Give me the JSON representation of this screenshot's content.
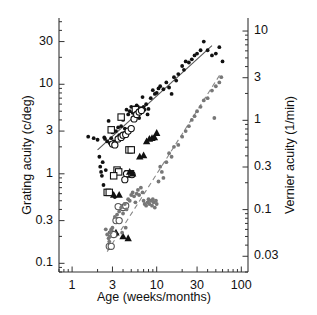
{
  "chart_data": {
    "type": "scatter",
    "title": "",
    "xlabel": "Age (weeks/months)",
    "ylabel": "Grating acuity (c/deg)",
    "ylabel_right": "Vernier acuity (1/min)",
    "xscale": "log",
    "yscale": "log",
    "xlim": [
      0.7,
      120
    ],
    "ylim": [
      0.08,
      55
    ],
    "ylim_right": [
      0.02,
      14
    ],
    "xticks": [
      1,
      3,
      10,
      30,
      100
    ],
    "xticklabels": [
      "1",
      "3",
      "10",
      "30",
      "100"
    ],
    "yticks": [
      0.1,
      0.3,
      1,
      3,
      10,
      30
    ],
    "yticklabels": [
      "0.1",
      "0.3",
      "1",
      "3",
      "10",
      "30"
    ],
    "yticks_right": [
      0.03,
      0.1,
      0.3,
      1,
      3,
      10
    ],
    "yticklabels_right": [
      "0.03",
      "0.1",
      "0.3",
      "1",
      "3",
      "10"
    ],
    "grid": false,
    "legend": "none",
    "series": [
      {
        "name": "grating-acuity-small-dots",
        "marker": "filled-circle-small",
        "color": "#111111",
        "points": [
          [
            1.55,
            2.6
          ],
          [
            1.8,
            2.5
          ],
          [
            2.0,
            2.4
          ],
          [
            2.1,
            1.55
          ],
          [
            2.15,
            1.2
          ],
          [
            2.2,
            1.05
          ],
          [
            2.25,
            0.95
          ],
          [
            2.3,
            1.35
          ],
          [
            2.35,
            0.75
          ],
          [
            2.4,
            2.55
          ],
          [
            2.45,
            2.45
          ],
          [
            2.5,
            1.1
          ],
          [
            2.55,
            0.6
          ],
          [
            2.6,
            2.3
          ],
          [
            2.7,
            3.9
          ],
          [
            2.8,
            2.2
          ],
          [
            2.9,
            2.5
          ],
          [
            3.0,
            2.9
          ],
          [
            3.1,
            2.3
          ],
          [
            3.2,
            0.55
          ],
          [
            3.3,
            3.0
          ],
          [
            3.5,
            3.3
          ],
          [
            3.6,
            2.7
          ],
          [
            3.8,
            3.4
          ],
          [
            4.0,
            4.0
          ],
          [
            4.2,
            3.2
          ],
          [
            4.4,
            5.2
          ],
          [
            4.6,
            4.6
          ],
          [
            4.8,
            5.0
          ],
          [
            5.0,
            5.6
          ],
          [
            5.2,
            4.8
          ],
          [
            5.4,
            5.5
          ],
          [
            5.6,
            5.3
          ],
          [
            5.8,
            5.8
          ],
          [
            6.0,
            5.6
          ],
          [
            6.2,
            4.2
          ],
          [
            6.5,
            5.4
          ],
          [
            6.8,
            7.2
          ],
          [
            7.0,
            5.6
          ],
          [
            7.2,
            5.2
          ],
          [
            7.5,
            6.0
          ],
          [
            7.8,
            4.6
          ],
          [
            8.0,
            5.3
          ],
          [
            8.5,
            7.0
          ],
          [
            9.0,
            8.6
          ],
          [
            9.5,
            7.8
          ],
          [
            10.0,
            8.0
          ],
          [
            10.5,
            9.0
          ],
          [
            11.0,
            9.5
          ],
          [
            12.0,
            8.8
          ],
          [
            13.0,
            10.5
          ],
          [
            14.0,
            9.2
          ],
          [
            15.0,
            7.8
          ],
          [
            16.0,
            12.0
          ],
          [
            17.0,
            11.0
          ],
          [
            18.0,
            13.0
          ],
          [
            20.0,
            16.0
          ],
          [
            21.0,
            14.5
          ],
          [
            22.0,
            18.0
          ],
          [
            24.0,
            17.5
          ],
          [
            26.0,
            19.0
          ],
          [
            28.0,
            21.0
          ],
          [
            30.0,
            22.0
          ],
          [
            33.0,
            24.0
          ],
          [
            36.0,
            30.0
          ],
          [
            40.0,
            24.0
          ],
          [
            45.0,
            21.0
          ],
          [
            50.0,
            22.0
          ],
          [
            55.0,
            26.0
          ],
          [
            60.0,
            18.0
          ]
        ]
      },
      {
        "name": "grating-acuity-open-squares",
        "marker": "open-square",
        "color": "#111111",
        "points": [
          [
            2.6,
            0.62
          ],
          [
            2.75,
            0.62
          ],
          [
            2.9,
            3.1
          ],
          [
            3.4,
            1.1
          ],
          [
            3.55,
            1.05
          ],
          [
            3.8,
            4.3
          ],
          [
            4.7,
            1.85
          ],
          [
            5.0,
            1.85
          ],
          [
            4.6,
            1.0
          ],
          [
            4.9,
            1.0
          ],
          [
            5.6,
            5.2
          ],
          [
            3.1,
            0.95
          ]
        ]
      },
      {
        "name": "grating-acuity-open-circles",
        "marker": "open-circle",
        "color": "#111111",
        "points": [
          [
            3.0,
            2.15
          ],
          [
            3.2,
            2.1
          ],
          [
            3.5,
            2.45
          ],
          [
            3.8,
            2.55
          ],
          [
            4.0,
            2.7
          ],
          [
            4.3,
            2.75
          ],
          [
            4.6,
            3.0
          ],
          [
            5.0,
            3.2
          ],
          [
            5.4,
            4.1
          ],
          [
            5.8,
            4.6
          ],
          [
            6.2,
            4.9
          ],
          [
            6.6,
            5.1
          ],
          [
            4.4,
            1.0
          ],
          [
            5.1,
            0.98
          ],
          [
            4.2,
            0.86
          ]
        ]
      },
      {
        "name": "vernier-acuity-filled-triangles",
        "marker": "filled-triangle",
        "color": "#111111",
        "points": [
          [
            3.1,
            0.58
          ],
          [
            3.6,
            0.58
          ],
          [
            4.8,
            1.05
          ],
          [
            5.2,
            1.0
          ],
          [
            6.3,
            1.55
          ],
          [
            7.0,
            1.6
          ],
          [
            7.6,
            2.3
          ],
          [
            8.2,
            2.45
          ],
          [
            8.8,
            2.5
          ],
          [
            9.4,
            2.55
          ],
          [
            10.0,
            2.85
          ],
          [
            3.3,
            0.22
          ],
          [
            4.0,
            0.2
          ],
          [
            4.6,
            0.19
          ]
        ]
      },
      {
        "name": "vernier-acuity-open-circles-small",
        "marker": "open-circle",
        "color": "#555555",
        "points": [
          [
            2.9,
            0.215
          ],
          [
            3.1,
            0.21
          ],
          [
            3.3,
            0.3
          ],
          [
            3.6,
            0.3
          ],
          [
            4.0,
            0.42
          ],
          [
            4.3,
            0.44
          ],
          [
            2.75,
            0.155
          ],
          [
            2.9,
            0.155
          ],
          [
            3.5,
            0.43
          ]
        ]
      },
      {
        "name": "vernier-acuity-gray-dots",
        "marker": "filled-circle-small",
        "color": "#777777",
        "points": [
          [
            2.6,
            0.21
          ],
          [
            2.7,
            0.19
          ],
          [
            2.75,
            0.175
          ],
          [
            2.8,
            0.2
          ],
          [
            2.85,
            0.22
          ],
          [
            2.9,
            0.24
          ],
          [
            3.0,
            0.25
          ],
          [
            3.2,
            0.33
          ],
          [
            3.4,
            0.35
          ],
          [
            3.6,
            0.38
          ],
          [
            3.8,
            0.42
          ],
          [
            4.0,
            0.36
          ],
          [
            4.2,
            0.46
          ],
          [
            4.4,
            0.4
          ],
          [
            4.6,
            0.52
          ],
          [
            4.8,
            0.5
          ],
          [
            5.0,
            0.58
          ],
          [
            5.2,
            0.62
          ],
          [
            5.4,
            0.56
          ],
          [
            5.6,
            0.48
          ],
          [
            5.8,
            0.6
          ],
          [
            6.0,
            0.66
          ],
          [
            6.2,
            0.58
          ],
          [
            6.5,
            0.7
          ],
          [
            6.8,
            0.62
          ],
          [
            7.0,
            0.5
          ],
          [
            7.2,
            0.46
          ],
          [
            7.5,
            0.44
          ],
          [
            7.8,
            0.48
          ],
          [
            8.0,
            0.52
          ],
          [
            8.2,
            0.46
          ],
          [
            8.5,
            0.5
          ],
          [
            8.8,
            0.44
          ],
          [
            9.0,
            0.52
          ],
          [
            9.2,
            0.48
          ],
          [
            9.5,
            0.42
          ],
          [
            9.8,
            0.5
          ],
          [
            10.0,
            0.46
          ],
          [
            10.5,
            0.82
          ],
          [
            11.0,
            1.2
          ],
          [
            11.5,
            1.05
          ],
          [
            12.0,
            0.9
          ],
          [
            13.0,
            1.35
          ],
          [
            14.0,
            1.7
          ],
          [
            15.0,
            1.55
          ],
          [
            16.0,
            2.0
          ],
          [
            18.0,
            2.1
          ],
          [
            20.0,
            2.6
          ],
          [
            22.0,
            3.0
          ],
          [
            24.0,
            3.4
          ],
          [
            26.0,
            4.0
          ],
          [
            28.0,
            4.4
          ],
          [
            30.0,
            5.0
          ],
          [
            33.0,
            5.6
          ],
          [
            36.0,
            6.6
          ],
          [
            40.0,
            7.0
          ],
          [
            45.0,
            8.5
          ],
          [
            50.0,
            9.5
          ],
          [
            55.0,
            10.5
          ],
          [
            58.0,
            12.0
          ],
          [
            48.0,
            4.2
          ],
          [
            2.5,
            0.24
          ],
          [
            3.9,
            0.22
          ],
          [
            4.3,
            0.25
          ]
        ]
      }
    ],
    "fit_lines": [
      {
        "name": "grating-acuity-fit",
        "style": "solid",
        "color": "#555555",
        "x0": 2.0,
        "y0": 1.85,
        "x1": 45.0,
        "y1": 27.0
      },
      {
        "name": "vernier-acuity-fit",
        "style": "dashed",
        "color": "#888888",
        "x0": 2.6,
        "y0": 0.135,
        "x1": 58.0,
        "y1": 13.5
      }
    ]
  },
  "axes": {
    "left_title": "Grating acuity (c/deg)",
    "right_title": "Vernier acuity (1/min)",
    "x_title": "Age (weeks/months)"
  }
}
